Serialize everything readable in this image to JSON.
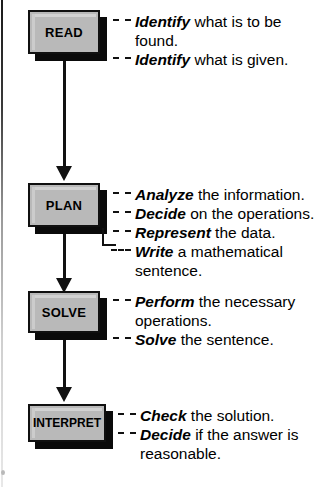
{
  "diagram": {
    "type": "flowchart",
    "orientation": "vertical",
    "colors": {
      "box_fill": "#b9b9b9",
      "box_border": "#101010",
      "shadow": "#0a0a0a",
      "text": "#000000",
      "background": "#ffffff"
    },
    "steps": [
      {
        "id": "read",
        "label": "READ",
        "items": [
          {
            "lead": "Identify",
            "rest": " what is to be",
            "cont": "found."
          },
          {
            "lead": "Identify",
            "rest": " what is given.",
            "cont": ""
          }
        ]
      },
      {
        "id": "plan",
        "label": "PLAN",
        "items": [
          {
            "lead": "Analyze",
            "rest": " the information.",
            "cont": ""
          },
          {
            "lead": "Decide",
            "rest": " on the operations.",
            "cont": ""
          },
          {
            "lead": "Represent",
            "rest": " the data.",
            "cont": ""
          },
          {
            "lead": "Write",
            "rest": " a mathematical",
            "cont": "sentence."
          }
        ]
      },
      {
        "id": "solve",
        "label": "SOLVE",
        "items": [
          {
            "lead": "Perform",
            "rest": " the necessary",
            "cont": "operations."
          },
          {
            "lead": "Solve",
            "rest": " the sentence.",
            "cont": ""
          }
        ]
      },
      {
        "id": "interpret",
        "label": "INTERPRET",
        "items": [
          {
            "lead": "Check",
            "rest": " the solution.",
            "cont": ""
          },
          {
            "lead": "Decide",
            "rest": " if the answer is",
            "cont": "reasonable."
          }
        ]
      }
    ],
    "connectors": [
      {
        "from": "read",
        "to": "plan"
      },
      {
        "from": "plan",
        "to": "solve"
      },
      {
        "from": "solve",
        "to": "interpret"
      }
    ]
  }
}
